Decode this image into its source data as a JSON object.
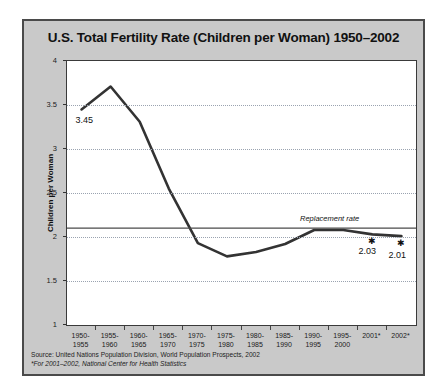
{
  "chart_data": {
    "type": "line",
    "title": "U.S. Total Fertility Rate (Children per Woman) 1950–2002",
    "xlabel": "",
    "ylabel": "Children per Woman",
    "ylim": [
      1,
      4
    ],
    "yticks": [
      1,
      1.5,
      2,
      2.5,
      3,
      3.5,
      4
    ],
    "ytick_labels": [
      "1",
      "1.5",
      "2",
      "2.5",
      "3",
      "3.5",
      "4"
    ],
    "grid": true,
    "legend": "none",
    "categories": [
      "1950-\n1955",
      "1955-\n1960",
      "1960-\n1965",
      "1965-\n1970",
      "1970-\n1975",
      "1975-\n1980",
      "1980-\n1985",
      "1985-\n1990",
      "1990-\n1995",
      "1995-\n2000",
      "2001*",
      "2002*"
    ],
    "category_lines": [
      [
        "1950-",
        "1955"
      ],
      [
        "1955-",
        "1960"
      ],
      [
        "1960-",
        "1965"
      ],
      [
        "1965-",
        "1970"
      ],
      [
        "1970-",
        "1975"
      ],
      [
        "1975-",
        "1980"
      ],
      [
        "1980-",
        "1985"
      ],
      [
        "1985-",
        "1990"
      ],
      [
        "1990-",
        "1995"
      ],
      [
        "1995-",
        "2000"
      ],
      [
        "2001*",
        ""
      ],
      [
        "2002*",
        ""
      ]
    ],
    "values": [
      3.45,
      3.71,
      3.31,
      2.55,
      1.93,
      1.78,
      1.83,
      1.92,
      2.08,
      2.08,
      2.03,
      2.01
    ],
    "series": [
      {
        "name": "U.S. Total Fertility Rate",
        "values": [
          3.45,
          3.71,
          3.31,
          2.55,
          1.93,
          1.78,
          1.83,
          1.92,
          2.08,
          2.08,
          2.03,
          2.01
        ]
      }
    ],
    "annotations": [
      {
        "text": "3.45",
        "category": "1950-1955",
        "value": 3.45
      },
      {
        "text": "2.03",
        "category": "2001*",
        "value": 2.03
      },
      {
        "text": "2.01",
        "category": "2002*",
        "value": 2.01
      }
    ],
    "reference_line": {
      "label": "Replacement rate",
      "value": 2.1
    },
    "markers": [
      {
        "category": "2001*",
        "value": 2.03,
        "glyph": "✱"
      },
      {
        "category": "2002*",
        "value": 2.01,
        "glyph": "✱"
      }
    ],
    "colors": {
      "line": "#333333",
      "panel_background": "#c9c9c9",
      "plot_background": "#ffffff",
      "gridline": "#9aa3b0",
      "border": "#4a4a4a"
    }
  },
  "labels": {
    "value_start": "3.45",
    "value_2001": "2.03",
    "value_2002": "2.01",
    "replacement_rate": "Replacement rate"
  },
  "footer": {
    "source": "Source: United Nations Population Division, World Population Prospects, 2002",
    "note": "*For 2001–2002, National Center for Health Statistics"
  }
}
